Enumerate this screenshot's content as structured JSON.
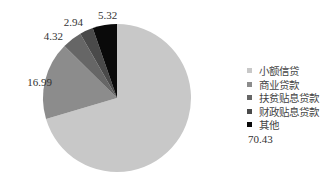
{
  "chart_data": {
    "type": "pie",
    "title": "",
    "categories": [
      "小额信贷",
      "商业贷款",
      "扶贫贴息贷款",
      "财政贴息贷款",
      "其他"
    ],
    "values": [
      70.43,
      16.99,
      4.32,
      2.94,
      5.32
    ],
    "colors": [
      "#c8c8c8",
      "#8c8c8c",
      "#666666",
      "#4a4a4a",
      "#0a0a0a"
    ],
    "start_angle": "12 o'clock",
    "direction": "clockwise",
    "legend_position": "right",
    "data_labels": [
      "70.43",
      "16.99",
      "4.32",
      "2.94",
      "5.32"
    ]
  },
  "legend": {
    "items": [
      {
        "label": "小额信贷",
        "color": "#c8c8c8"
      },
      {
        "label": "商业贷款",
        "color": "#8c8c8c"
      },
      {
        "label": "扶贫贴息贷款",
        "color": "#666666"
      },
      {
        "label": "财政贴息贷款",
        "color": "#4a4a4a"
      },
      {
        "label": "其他",
        "color": "#0a0a0a"
      }
    ]
  }
}
